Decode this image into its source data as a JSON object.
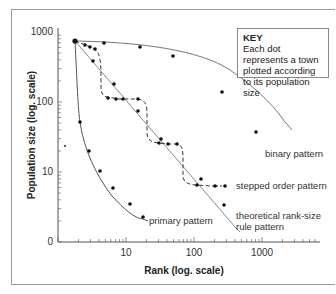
{
  "chart_data": {
    "type": "line",
    "title": "",
    "xlabel": "Rank (log. scale)",
    "ylabel": "Population size (log. scale)",
    "xscale": "log",
    "yscale": "log",
    "x_ticks": [
      "10",
      "100",
      "1000"
    ],
    "y_ticks": [
      "0",
      "10",
      "100",
      "1000"
    ],
    "grid": false,
    "legend": {
      "title": "KEY",
      "text": "Each dot represents a town plotted according to its population size",
      "position": "top-right"
    },
    "series": [
      {
        "name": "binary pattern",
        "style": "solid",
        "points": [
          [
            1.8,
            740
          ],
          [
            5,
            720
          ],
          [
            25,
            650
          ],
          [
            100,
            520
          ],
          [
            700,
            200
          ],
          [
            1000,
            38
          ]
        ]
      },
      {
        "name": "stepped order pattern",
        "style": "dashed",
        "points": [
          [
            1.8,
            740
          ],
          [
            2.7,
            650
          ],
          [
            3.4,
            620
          ],
          [
            4.0,
            600
          ],
          [
            3.5,
            155
          ],
          [
            4.6,
            120
          ],
          [
            6,
            115
          ],
          [
            9,
            110
          ],
          [
            17,
            112
          ],
          [
            30,
            30
          ],
          [
            37,
            25
          ],
          [
            50,
            22
          ],
          [
            60,
            22
          ],
          [
            100,
            6.5
          ],
          [
            130,
            6.3
          ],
          [
            200,
            6.2
          ],
          [
            300,
            6.0
          ]
        ]
      },
      {
        "name": "theoretical rank-size rule pattern",
        "style": "solid",
        "points": [
          [
            1.8,
            740
          ],
          [
            3.3,
            370
          ],
          [
            7,
            185
          ],
          [
            14,
            95
          ],
          [
            30,
            48
          ],
          [
            60,
            24
          ],
          [
            120,
            12
          ],
          [
            280,
            4.5
          ]
        ]
      },
      {
        "name": "primary pattern",
        "style": "solid",
        "points": [
          [
            1.8,
            740
          ],
          [
            2.2,
            45
          ],
          [
            3.5,
            20
          ],
          [
            5,
            11
          ],
          [
            9,
            6
          ],
          [
            15,
            3.5
          ],
          [
            23,
            2.2
          ]
        ]
      }
    ],
    "annotations": [
      "binary pattern",
      "stepped order pattern",
      "theoretical rank-size rule pattern",
      "primary pattern"
    ]
  }
}
